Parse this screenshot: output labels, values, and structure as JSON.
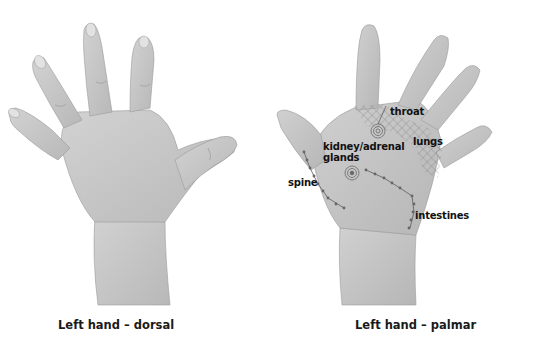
{
  "figure": {
    "left_panel": {
      "caption": "Left hand – dorsal"
    },
    "right_panel": {
      "caption": "Left hand – palmar",
      "labels": {
        "throat": "throat",
        "lungs": "lungs",
        "kidney_line1": "kidney/adrenal",
        "kidney_line2": "glands",
        "spine": "spine",
        "intestines": "intestines"
      }
    },
    "colors": {
      "background": "#ffffff",
      "skin": "#c9c9c9",
      "skin_shadow": "#a9a9a9",
      "annotation": "#555555",
      "text": "#111111"
    }
  }
}
